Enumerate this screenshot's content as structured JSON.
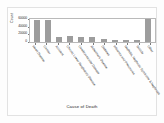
{
  "chart_data": {
    "type": "bar",
    "title": "",
    "xlabel": "Cause of Death",
    "ylabel": "Count",
    "categories": [
      "Heart Disease",
      "Cancer",
      "Accident",
      "Chronic Lower Respiratory Disease",
      "Cerebrovascular Disease",
      "Alzheimer's Disease",
      "Diabetes",
      "Influenza and Pneumonia",
      "Nephritis, Nephrotic Syndrome & Nephrosis",
      "Suicide",
      "Other"
    ],
    "values": [
      58000,
      57000,
      14000,
      16000,
      13000,
      12000,
      8000,
      6000,
      5000,
      4500,
      60000
    ],
    "ylim": [
      0,
      60000
    ],
    "yticks": [
      0,
      20000,
      40000,
      60000
    ],
    "ytick_labels": [
      "0",
      "20000",
      "40000",
      "60000"
    ],
    "grid": false,
    "legend": false,
    "bar_color": "#9d9d9d",
    "plot_bg": "#ffffff",
    "figure_bg": "#fdfdfd",
    "axis_color": "#b9b9b9"
  }
}
